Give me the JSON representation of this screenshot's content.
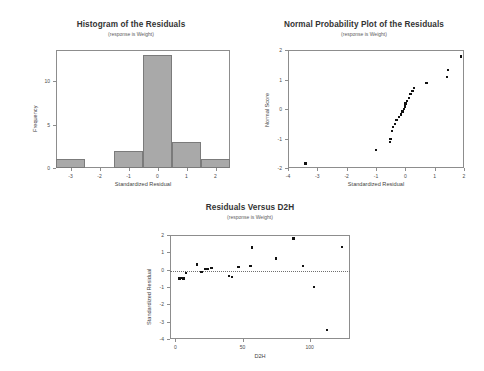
{
  "page": {
    "background": "#ffffff",
    "bar_fill": "#a9a9a9",
    "bar_stroke": "#7b7b7b",
    "point_color": "#111111",
    "axis_color": "#8d8d8d"
  },
  "charts": [
    {
      "id": "histogram-residuals",
      "title": "Histogram of the Residuals",
      "subtitle": "(response is Weight)",
      "xlabel": "Standardized Residual",
      "ylabel": "Frequency",
      "xticks": [
        "-3",
        "-2",
        "-1",
        "0",
        "1",
        "2"
      ],
      "yticks": [
        "0",
        "5",
        "10"
      ]
    },
    {
      "id": "normal-probability-plot",
      "title": "Normal Probability Plot of the Residuals",
      "subtitle": "(response is Weight)",
      "xlabel": "Standardized Residual",
      "ylabel": "Normal Score",
      "xticks": [
        "-4",
        "-3",
        "-2",
        "-1",
        "0",
        "1",
        "2"
      ],
      "yticks": [
        "-2",
        "-1",
        "0",
        "1",
        "2"
      ]
    },
    {
      "id": "residuals-versus-d2h",
      "title": "Residuals Versus D2H",
      "subtitle": "(response is Weight)",
      "xlabel": "D2H",
      "ylabel": "Standardized Residual",
      "xticks": [
        "0",
        "50",
        "100"
      ],
      "yticks": [
        "-4",
        "-3",
        "-2",
        "-1",
        "0",
        "1",
        "2"
      ]
    }
  ],
  "chart_data": [
    {
      "type": "bar",
      "id": "histogram-residuals",
      "title": "Histogram of the Residuals",
      "subtitle": "(response is Weight)",
      "xlabel": "Standardized Residual",
      "ylabel": "Frequency",
      "categories": [
        "-3",
        "-1",
        "0",
        "1",
        "2"
      ],
      "bin_centers": [
        -3,
        -1,
        0,
        1,
        2
      ],
      "bin_width": 1,
      "values": [
        1,
        2,
        13,
        3,
        1
      ],
      "xlim": [
        -3.5,
        2.5
      ],
      "ylim": [
        0,
        13.6
      ],
      "xticks": [
        -3,
        -2,
        -1,
        0,
        1,
        2
      ],
      "yticks": [
        0,
        5,
        10
      ],
      "grid": false,
      "legend": false
    },
    {
      "type": "scatter",
      "id": "normal-probability-plot",
      "title": "Normal Probability Plot of the Residuals",
      "subtitle": "(response is Weight)",
      "xlabel": "Standardized Residual",
      "ylabel": "Normal Score",
      "xlim": [
        -4,
        2
      ],
      "ylim": [
        -2,
        2
      ],
      "xticks": [
        -4,
        -3,
        -2,
        -1,
        0,
        1,
        2
      ],
      "yticks": [
        -2,
        -1,
        0,
        1,
        2
      ],
      "grid": false,
      "legend": false,
      "points": [
        {
          "x": -3.4,
          "y": -1.85
        },
        {
          "x": -1.0,
          "y": -1.4
        },
        {
          "x": -0.52,
          "y": -1.12
        },
        {
          "x": -0.5,
          "y": -1.02
        },
        {
          "x": -0.45,
          "y": -0.75
        },
        {
          "x": -0.42,
          "y": -0.62
        },
        {
          "x": -0.35,
          "y": -0.5
        },
        {
          "x": -0.3,
          "y": -0.38
        },
        {
          "x": -0.22,
          "y": -0.27
        },
        {
          "x": -0.15,
          "y": -0.18
        },
        {
          "x": -0.1,
          "y": -0.08
        },
        {
          "x": -0.05,
          "y": 0.0
        },
        {
          "x": -0.02,
          "y": 0.08
        },
        {
          "x": 0.0,
          "y": 0.18
        },
        {
          "x": 0.05,
          "y": 0.28
        },
        {
          "x": 0.12,
          "y": 0.38
        },
        {
          "x": 0.18,
          "y": 0.5
        },
        {
          "x": 0.25,
          "y": 0.62
        },
        {
          "x": 0.3,
          "y": 0.72
        },
        {
          "x": 0.72,
          "y": 0.88
        },
        {
          "x": 1.42,
          "y": 1.08
        },
        {
          "x": 1.45,
          "y": 1.32
        },
        {
          "x": 1.9,
          "y": 1.78
        }
      ]
    },
    {
      "type": "scatter",
      "id": "residuals-versus-d2h",
      "title": "Residuals Versus D2H",
      "subtitle": "(response is Weight)",
      "xlabel": "D2H",
      "ylabel": "Standardized Residual",
      "xlim": [
        -4,
        130
      ],
      "ylim": [
        -4,
        2
      ],
      "xticks": [
        0,
        50,
        100
      ],
      "yticks": [
        -4,
        -3,
        -2,
        -1,
        0,
        1,
        2
      ],
      "reference_line": {
        "y": -0.08,
        "style": "dotted"
      },
      "grid": false,
      "legend": false,
      "points": [
        {
          "x": 2.5,
          "y": -0.5
        },
        {
          "x": 3.5,
          "y": -0.52
        },
        {
          "x": 4.0,
          "y": -0.48
        },
        {
          "x": 6.0,
          "y": -0.5
        },
        {
          "x": 8.0,
          "y": -0.2
        },
        {
          "x": 16.0,
          "y": 0.3
        },
        {
          "x": 19.0,
          "y": -0.12
        },
        {
          "x": 20.0,
          "y": -0.15
        },
        {
          "x": 22.0,
          "y": 0.05
        },
        {
          "x": 24.0,
          "y": 0.03
        },
        {
          "x": 27.0,
          "y": 0.08
        },
        {
          "x": 40.0,
          "y": -0.35
        },
        {
          "x": 42.0,
          "y": -0.42
        },
        {
          "x": 47.0,
          "y": 0.15
        },
        {
          "x": 56.0,
          "y": 0.2
        },
        {
          "x": 57.0,
          "y": 1.28
        },
        {
          "x": 75.0,
          "y": 0.65
        },
        {
          "x": 88.0,
          "y": 1.8
        },
        {
          "x": 95.0,
          "y": 0.2
        },
        {
          "x": 103.0,
          "y": -1.0
        },
        {
          "x": 113.0,
          "y": -3.48
        },
        {
          "x": 124.0,
          "y": 1.3
        }
      ]
    }
  ]
}
